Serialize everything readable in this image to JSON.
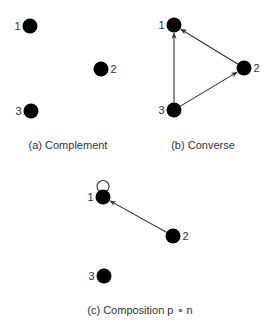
{
  "style": {
    "node_color": "#000000",
    "edge_color": "#333333",
    "text_color": "#333333",
    "background": "#ffffff"
  },
  "panels": [
    {
      "id": "a",
      "caption": "(a) Complement",
      "caption_pos": [
        68,
        149
      ],
      "nodes": [
        {
          "id": "1",
          "label": "1",
          "x": 30,
          "y": 26,
          "label_side": "left"
        },
        {
          "id": "2",
          "label": "2",
          "x": 101,
          "y": 69,
          "label_side": "right"
        },
        {
          "id": "3",
          "label": "3",
          "x": 31,
          "y": 111,
          "label_side": "left"
        }
      ],
      "edges": [],
      "loops": []
    },
    {
      "id": "b",
      "caption": "(b) Converse",
      "caption_pos": [
        203,
        149
      ],
      "nodes": [
        {
          "id": "1",
          "label": "1",
          "x": 174,
          "y": 25,
          "label_side": "left"
        },
        {
          "id": "2",
          "label": "2",
          "x": 244,
          "y": 68,
          "label_side": "right"
        },
        {
          "id": "3",
          "label": "3",
          "x": 174,
          "y": 110,
          "label_side": "left"
        }
      ],
      "edges": [
        {
          "from": "3",
          "to": "1"
        },
        {
          "from": "2",
          "to": "1"
        },
        {
          "from": "3",
          "to": "2"
        }
      ],
      "loops": []
    },
    {
      "id": "c",
      "caption": "(c) Composition p ∘ n",
      "caption_pos": [
        140,
        314
      ],
      "nodes": [
        {
          "id": "1",
          "label": "1",
          "x": 103,
          "y": 197,
          "label_side": "left"
        },
        {
          "id": "2",
          "label": "2",
          "x": 173,
          "y": 236,
          "label_side": "right"
        },
        {
          "id": "3",
          "label": "3",
          "x": 104,
          "y": 276,
          "label_side": "left"
        }
      ],
      "edges": [
        {
          "from": "2",
          "to": "1"
        }
      ],
      "loops": [
        {
          "node": "1"
        }
      ]
    }
  ]
}
